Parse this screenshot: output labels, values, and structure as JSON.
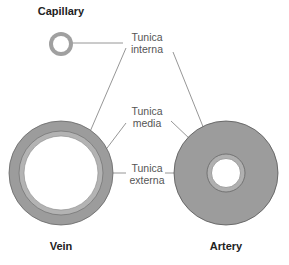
{
  "titles": {
    "capillary": "Capillary",
    "vein": "Vein",
    "artery": "Artery"
  },
  "labels": {
    "interna": {
      "line1": "Tunica",
      "line2": "interna"
    },
    "media": {
      "line1": "Tunica",
      "line2": "media"
    },
    "externa": {
      "line1": "Tunica",
      "line2": "externa"
    }
  },
  "colors": {
    "wall": "#9c9c9c",
    "wall_light": "#b4b4b4",
    "outline": "#555555",
    "leader": "#8a8a8a",
    "lumen": "#ffffff"
  }
}
